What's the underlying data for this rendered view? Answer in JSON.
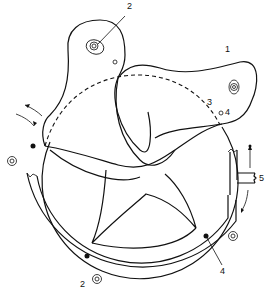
{
  "diagram": {
    "type": "mechanical line drawing",
    "labels": [
      {
        "id": "label-1",
        "text": "1",
        "x": 225,
        "y": 49
      },
      {
        "id": "label-2-top",
        "text": "2",
        "x": 128,
        "y": 6
      },
      {
        "id": "label-3",
        "text": "3",
        "x": 208,
        "y": 100
      },
      {
        "id": "label-4-top",
        "text": "4",
        "x": 226,
        "y": 109
      },
      {
        "id": "label-5",
        "text": "5",
        "x": 259,
        "y": 174
      },
      {
        "id": "label-4-bottom",
        "text": "4",
        "x": 221,
        "y": 268
      },
      {
        "id": "label-2-bottom",
        "text": "2",
        "x": 80,
        "y": 280
      }
    ],
    "colors": {
      "line": "#111111",
      "background": "#ffffff"
    }
  }
}
